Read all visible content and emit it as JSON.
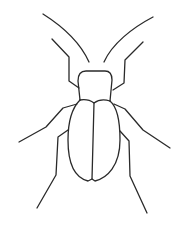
{
  "image": {
    "subject": "beetle line drawing",
    "background_color": "#ffffff",
    "stroke_color": "#2a2a2a"
  }
}
